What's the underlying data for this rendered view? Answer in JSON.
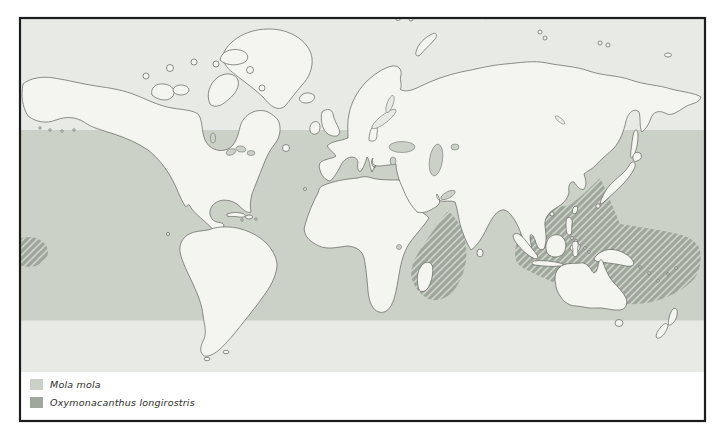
{
  "legend": {
    "items": [
      {
        "label": "Mola mola",
        "color": "#cbd1c7",
        "style": "solid-band"
      },
      {
        "label": "Oxymonacanthus longirostris",
        "color": "#9fa79c",
        "style": "hatched"
      }
    ]
  },
  "map": {
    "colors": {
      "polar_ocean": "#e8eae5",
      "band_ocean": "#cbd1c7",
      "hatch_stripe": "#9fa79c",
      "land": "#f4f5f1",
      "coastline": "#5f625c",
      "frame": "#1d1d1d",
      "background": "#ffffff"
    }
  }
}
